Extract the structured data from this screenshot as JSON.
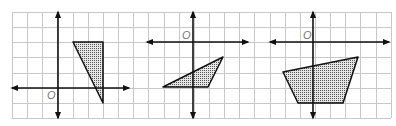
{
  "figure": {
    "grid": {
      "x0": 12,
      "y0": 12,
      "x1": 391,
      "y1": 118,
      "cell": 15.15,
      "cols": 25,
      "rows": 7,
      "line_color": "#c8c8c8"
    },
    "colors": {
      "axis": "#111111",
      "shape_stroke": "#111111",
      "shape_fill_dots": "#555555",
      "origin_label": "#777777"
    },
    "panels": [
      {
        "name": "panel-1",
        "origin_label": "O",
        "axis": {
          "x_axis_y": 88,
          "x_from": 12,
          "x_to": 129,
          "y_axis_x": 58,
          "y_from": 12,
          "y_to": 118
        },
        "origin_label_pos": {
          "x": 47,
          "y": 99
        },
        "shape": {
          "type": "triangle",
          "points": "73,42 103,42 103,103"
        }
      },
      {
        "name": "panel-2",
        "origin_label": "O",
        "axis": {
          "x_axis_y": 42,
          "x_from": 147,
          "x_to": 248,
          "y_axis_x": 193,
          "y_from": 12,
          "y_to": 118
        },
        "origin_label_pos": {
          "x": 182,
          "y": 39
        },
        "shape": {
          "type": "triangle",
          "points": "163,87 223,57 208,87"
        }
      },
      {
        "name": "panel-3",
        "origin_label": "O",
        "axis": {
          "x_axis_y": 42,
          "x_from": 270,
          "x_to": 389,
          "y_axis_x": 313,
          "y_from": 12,
          "y_to": 118
        },
        "origin_label_pos": {
          "x": 303,
          "y": 39
        },
        "shape": {
          "type": "quadrilateral",
          "points": "283,72 358,57 343,103 298,103"
        }
      }
    ]
  }
}
